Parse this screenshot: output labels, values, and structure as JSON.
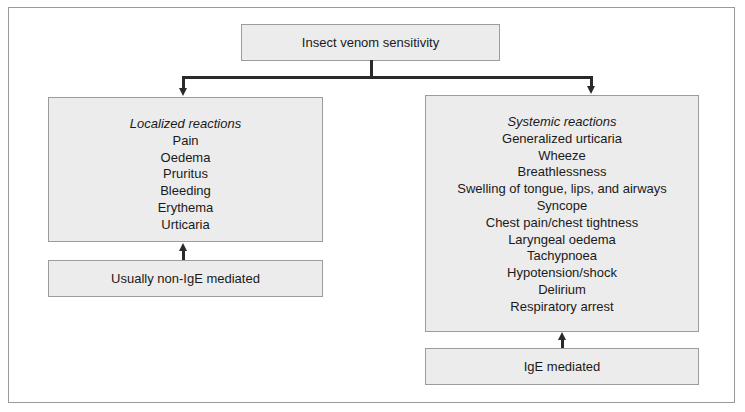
{
  "root": {
    "label": "Insect venom sensitivity"
  },
  "left": {
    "heading": "Localized reactions",
    "items": [
      "Pain",
      "Oedema",
      "Pruritus",
      "Bleeding",
      "Erythema",
      "Urticaria"
    ],
    "mechanism": "Usually non-IgE mediated"
  },
  "right": {
    "heading": "Systemic reactions",
    "items": [
      "Generalized urticaria",
      "Wheeze",
      "Breathlessness",
      "Swelling of tongue, lips, and airways",
      "Syncope",
      "Chest pain/chest tightness",
      "Laryngeal oedema",
      "Tachypnoea",
      "Hypotension/shock",
      "Delirium",
      "Respiratory arrest"
    ],
    "mechanism": "IgE mediated"
  },
  "colors": {
    "box_fill": "#ececec",
    "box_border": "#9c9c9c",
    "connector": "#2a2a2a"
  }
}
